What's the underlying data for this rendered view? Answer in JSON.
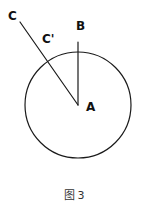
{
  "figure": {
    "caption_label": "图",
    "caption_number": "3",
    "background_color": "#ffffff",
    "stroke_color": "#1a1a1a",
    "label_color": "#111111"
  },
  "labels": {
    "center": "A",
    "top_point": "B",
    "outer_point": "C",
    "intersection_point": "C'"
  },
  "geometry": {
    "circle": {
      "cx": 78,
      "cy": 105,
      "r": 53
    },
    "radius_segment": {
      "x1": 78,
      "y1": 42,
      "x2": 78,
      "y2": 105
    },
    "chord_segment": {
      "x1": 20,
      "y1": 22,
      "x2": 78,
      "y2": 105
    },
    "intersection": {
      "x": 40,
      "y": 48
    },
    "stroke_width": 1.2
  },
  "chart_data": {
    "type": "diagram",
    "points": [
      {
        "name": "A",
        "x": 78,
        "y": 105,
        "role": "circle-center"
      },
      {
        "name": "B",
        "x": 78,
        "y": 42,
        "role": "point-on-circle-top"
      },
      {
        "name": "C",
        "x": 20,
        "y": 22,
        "role": "external-point"
      },
      {
        "name": "C'",
        "x": 40,
        "y": 48,
        "role": "intersection-with-circle"
      }
    ],
    "shapes": [
      {
        "type": "circle",
        "cx": 78,
        "cy": 105,
        "r": 53
      },
      {
        "type": "segment",
        "from": "B",
        "to": "A"
      },
      {
        "type": "segment",
        "from": "C",
        "to": "A"
      }
    ]
  }
}
